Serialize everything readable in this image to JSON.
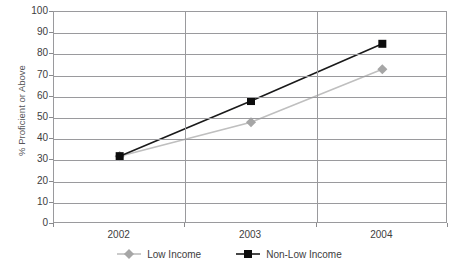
{
  "chart_data": {
    "type": "line",
    "title": "",
    "xlabel": "",
    "ylabel": "% Proficient or Above",
    "categories": [
      "2002",
      "2003",
      "2004"
    ],
    "ylim": [
      0,
      100
    ],
    "ytick_step": 10,
    "yticks": [
      "100",
      "90",
      "80",
      "70",
      "60",
      "50",
      "40",
      "30",
      "20",
      "10",
      "0"
    ],
    "grid": true,
    "legend_position": "bottom",
    "series": [
      {
        "name": "Low Income",
        "values": [
          32,
          48,
          73
        ],
        "color": "#BFBFBF",
        "marker": "diamond",
        "marker_color": "#A6A6A6"
      },
      {
        "name": "Non-Low Income",
        "values": [
          32,
          58,
          85
        ],
        "color": "#1A1A1A",
        "marker": "square",
        "marker_color": "#0D0D0D"
      }
    ]
  },
  "axes": {
    "y_title": "% Proficient or Above"
  },
  "legend": {
    "items": [
      {
        "label": "Low Income"
      },
      {
        "label": "Non-Low Income"
      }
    ]
  }
}
